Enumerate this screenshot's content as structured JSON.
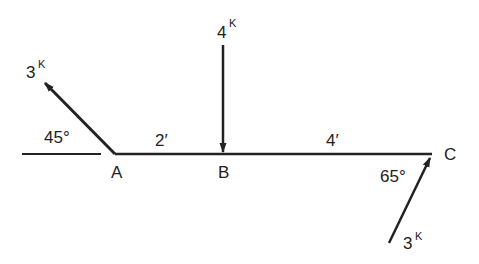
{
  "diagram": {
    "type": "beam-force-diagram",
    "stroke_color": "#222222",
    "points": [
      {
        "id": "A",
        "label": "A",
        "x": 115,
        "y": 154
      },
      {
        "id": "B",
        "label": "B",
        "x": 223,
        "y": 154
      },
      {
        "id": "C",
        "label": "C",
        "x": 432,
        "y": 154
      }
    ],
    "segments": [
      {
        "from": "A",
        "to": "B",
        "length_label": "2′"
      },
      {
        "from": "B",
        "to": "C",
        "length_label": "4′"
      }
    ],
    "reference_line": {
      "label": "horizontal reference at A"
    },
    "forces": [
      {
        "at": "A",
        "magnitude": "3",
        "unit": "K",
        "angle_label": "45°",
        "direction": "up-left, away from A"
      },
      {
        "at": "B",
        "magnitude": "4",
        "unit": "K",
        "angle_label": "",
        "direction": "vertical down, toward B"
      },
      {
        "at": "C",
        "magnitude": "3",
        "unit": "K",
        "angle_label": "65°",
        "direction": "up-right, toward C"
      }
    ]
  }
}
